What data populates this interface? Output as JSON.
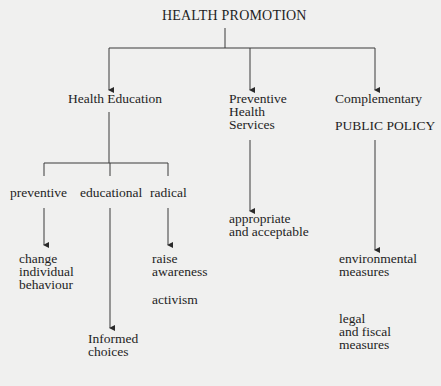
{
  "diagram": {
    "title": "HEALTH PROMOTION",
    "branches": {
      "health_education": {
        "label": "Health Education",
        "approaches": [
          {
            "label": "preventive",
            "outcome": [
              "change",
              "individual",
              "behaviour"
            ]
          },
          {
            "label": "educational",
            "outcome": [
              "Informed",
              "choices"
            ]
          },
          {
            "label": "radical",
            "outcome": [
              "raise",
              "awareness"
            ],
            "extra": "activism"
          }
        ]
      },
      "preventive_services": {
        "label_lines": [
          "Preventive",
          "Health",
          "Services"
        ],
        "outcome": [
          "appropriate",
          "and acceptable"
        ]
      },
      "public_policy": {
        "label": "Complementary",
        "sublabel": "PUBLIC POLICY",
        "outcome": [
          "environmental",
          "measures"
        ],
        "outcome2": [
          "legal",
          "and fiscal",
          "measures"
        ]
      }
    }
  }
}
